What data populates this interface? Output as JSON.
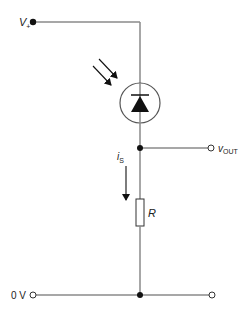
{
  "diagram": {
    "type": "circuit",
    "colors": {
      "wire": "#8a8a8a",
      "ink": "#111111",
      "text": "#222222"
    },
    "labels": {
      "supply_main": "V",
      "supply_sub": "+",
      "output_main": "v",
      "output_sub": "OUT",
      "current_main": "i",
      "current_sub": "S",
      "resistor": "R",
      "ground": "0 V"
    },
    "components": [
      {
        "id": "photodiode",
        "kind": "photodiode",
        "orientation": "reverse-biased (cathode up)"
      },
      {
        "id": "resistor",
        "kind": "resistor",
        "label": "R"
      }
    ],
    "nodes": [
      {
        "id": "supply",
        "label": "V+",
        "terminal": "filled"
      },
      {
        "id": "output",
        "label": "vOUT",
        "terminal": "open"
      },
      {
        "id": "ground-left",
        "label": "0 V",
        "terminal": "open"
      },
      {
        "id": "ground-right",
        "label": "",
        "terminal": "open"
      }
    ],
    "annotations": [
      {
        "kind": "light-arrows",
        "count": 2,
        "target": "photodiode"
      },
      {
        "kind": "current-arrow",
        "label": "iS",
        "direction": "down"
      }
    ]
  }
}
